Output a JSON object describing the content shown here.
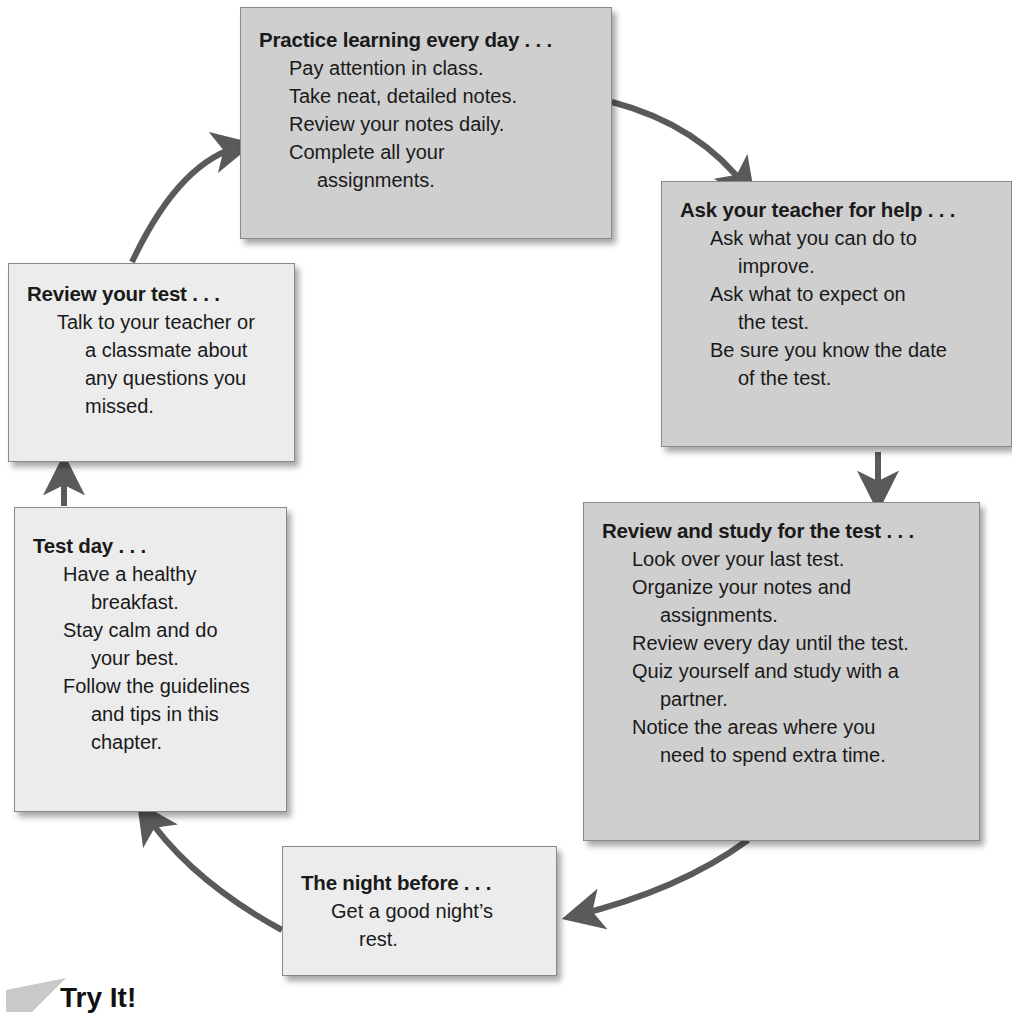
{
  "diagram": {
    "type": "cycle",
    "steps": [
      {
        "id": "practice",
        "title": "Practice learning every day . . .",
        "lines": [
          [
            "Pay attention in class."
          ],
          [
            "Take neat, detailed notes."
          ],
          [
            "Review your notes daily."
          ],
          [
            "Complete all your",
            "assignments."
          ]
        ]
      },
      {
        "id": "ask",
        "title": "Ask your teacher for help . . .",
        "lines": [
          [
            "Ask what you can do to",
            "improve."
          ],
          [
            "Ask what to expect on",
            "the test."
          ],
          [
            "Be sure you know the date",
            "of the test."
          ]
        ]
      },
      {
        "id": "study",
        "title": "Review and study for the test . . .",
        "lines": [
          [
            "Look over your last test."
          ],
          [
            "Organize your notes and",
            "assignments."
          ],
          [
            "Review every day until the test."
          ],
          [
            "Quiz yourself and study with a",
            "partner."
          ],
          [
            "Notice the areas where you",
            "need to spend extra time."
          ]
        ]
      },
      {
        "id": "night",
        "title": "The night before . . .",
        "lines": [
          [
            "Get a good night’s",
            "rest."
          ]
        ]
      },
      {
        "id": "testday",
        "title": "Test day . . .",
        "lines": [
          [
            "Have a healthy",
            "breakfast."
          ],
          [
            "Stay calm and do",
            "your best."
          ],
          [
            "Follow the guidelines",
            "and tips in this",
            "chapter."
          ]
        ]
      },
      {
        "id": "review",
        "title": "Review your test . . .",
        "lines": [
          [
            "Talk to your teacher or",
            "a classmate about",
            "any questions you",
            "missed."
          ]
        ]
      }
    ],
    "arrow_color": "#5a5a5a",
    "box_dark_color": "#cfcfcf",
    "box_light_color": "#ececec"
  },
  "footer": {
    "heading": "Try It!"
  }
}
